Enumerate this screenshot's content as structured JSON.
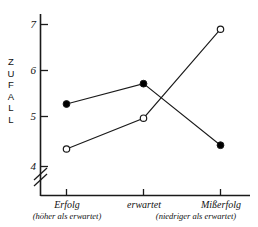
{
  "chart_data": {
    "type": "line",
    "title": "",
    "xlabel": "",
    "ylabel": "ZUFALL",
    "ylim": [
      3.72,
      7.3
    ],
    "grid": false,
    "legend": "none",
    "axis_break": true,
    "categories": [
      "Erfolg",
      "erwartet",
      "Mißerfolg"
    ],
    "category_sublabels": [
      "(höher als erwartet)",
      "",
      "(niedriger als erwartet)"
    ],
    "yticks": [
      "4",
      "5",
      "6",
      "7"
    ],
    "ytick_values": [
      4,
      5,
      6,
      7
    ],
    "series": [
      {
        "name": "filled",
        "marker": "filled-circle",
        "values": [
          5.32,
          5.75,
          4.45
        ]
      },
      {
        "name": "open",
        "marker": "open-circle",
        "values": [
          4.37,
          5.02,
          6.9
        ]
      }
    ]
  },
  "axis": {
    "y_title_letters": [
      "Z",
      "U",
      "F",
      "A",
      "L",
      "L"
    ]
  },
  "colors": {
    "line": "#1a1a1a",
    "marker_fill": "#000000",
    "marker_open_fill": "#ffffff",
    "background": "#ffffff"
  }
}
